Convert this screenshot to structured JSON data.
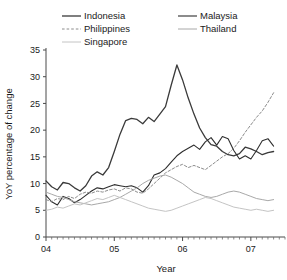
{
  "chart_data": {
    "type": "line",
    "title": "",
    "xlabel": "Year",
    "ylabel": "YoY percentage of change",
    "xlim": [
      2004.0,
      2007.5
    ],
    "ylim": [
      0,
      35
    ],
    "yticks": [
      0,
      5,
      10,
      15,
      20,
      25,
      30,
      35
    ],
    "ytick_labels": [
      "0",
      "5",
      "10",
      "15",
      "20",
      "25",
      "30",
      "35"
    ],
    "xticks": [
      2004,
      2005,
      2006,
      2007
    ],
    "xtick_labels": [
      "04",
      "05",
      "06",
      "07"
    ],
    "grid": false,
    "legend_position": "top",
    "legend_columns": 2,
    "x": [
      2004.0,
      2004.083,
      2004.167,
      2004.25,
      2004.333,
      2004.417,
      2004.5,
      2004.583,
      2004.667,
      2004.75,
      2004.833,
      2004.917,
      2005.0,
      2005.083,
      2005.167,
      2005.25,
      2005.333,
      2005.417,
      2005.5,
      2005.583,
      2005.667,
      2005.75,
      2005.833,
      2005.917,
      2006.0,
      2006.083,
      2006.167,
      2006.25,
      2006.333,
      2006.417,
      2006.5,
      2006.583,
      2006.667,
      2006.75,
      2006.833,
      2006.917,
      2007.0,
      2007.083,
      2007.167,
      2007.25,
      2007.333
    ],
    "series": [
      {
        "name": "Indonesia",
        "color": "#3a3a3a",
        "style": "solid",
        "width": 1.3,
        "values": [
          10.5,
          9.4,
          8.8,
          10.2,
          10.0,
          9.2,
          8.6,
          9.6,
          11.4,
          12.2,
          11.6,
          13.0,
          16.0,
          19.2,
          21.8,
          22.2,
          22.0,
          21.2,
          22.4,
          21.6,
          23.0,
          24.4,
          28.4,
          32.2,
          29.4,
          26.0,
          23.0,
          20.4,
          18.6,
          17.3,
          17.0,
          16.0,
          15.4,
          15.2,
          15.6,
          16.8,
          16.5,
          16.0,
          15.4,
          15.8,
          16.0
        ]
      },
      {
        "name": "Malaysia",
        "color": "#2e2e2e",
        "style": "solid",
        "width": 1.1,
        "values": [
          7.8,
          6.6,
          6.0,
          7.6,
          7.2,
          6.4,
          7.0,
          7.8,
          8.6,
          9.2,
          9.0,
          9.4,
          9.8,
          9.6,
          9.4,
          9.6,
          9.2,
          8.4,
          9.6,
          11.6,
          12.0,
          12.8,
          14.0,
          15.2,
          16.0,
          16.6,
          17.2,
          16.4,
          17.8,
          18.6,
          17.2,
          18.8,
          18.4,
          16.2,
          14.6,
          15.2,
          14.6,
          16.2,
          18.0,
          18.4,
          17.0
        ]
      },
      {
        "name": "Philippines",
        "color": "#8c8c8c",
        "style": "dashed",
        "width": 1.0,
        "values": [
          7.0,
          6.6,
          7.2,
          7.0,
          7.6,
          7.2,
          8.0,
          8.4,
          8.2,
          8.6,
          8.4,
          8.8,
          9.0,
          8.6,
          9.2,
          9.0,
          8.4,
          8.2,
          9.0,
          10.0,
          11.0,
          12.0,
          12.6,
          13.2,
          13.6,
          13.0,
          13.4,
          13.0,
          12.6,
          13.4,
          14.2,
          15.0,
          15.6,
          16.6,
          18.0,
          19.6,
          21.0,
          22.4,
          23.6,
          25.2,
          27.0
        ]
      },
      {
        "name": "Thailand",
        "color": "#a8a8a8",
        "style": "solid",
        "width": 1.0,
        "values": [
          8.4,
          8.0,
          7.6,
          7.4,
          7.0,
          6.6,
          6.4,
          6.2,
          6.0,
          6.2,
          6.4,
          6.6,
          7.0,
          7.4,
          8.0,
          8.6,
          9.2,
          10.0,
          10.6,
          11.0,
          11.4,
          11.6,
          11.2,
          10.6,
          10.0,
          9.2,
          8.4,
          8.0,
          7.6,
          7.4,
          7.6,
          8.0,
          8.4,
          8.6,
          8.4,
          8.0,
          7.6,
          7.2,
          7.0,
          6.8,
          7.0
        ]
      },
      {
        "name": "Singapore",
        "color": "#c4c4c4",
        "style": "solid",
        "width": 1.0,
        "values": [
          5.0,
          5.2,
          5.6,
          5.4,
          5.8,
          6.2,
          6.0,
          6.4,
          6.8,
          7.2,
          7.0,
          7.4,
          7.8,
          7.4,
          7.0,
          6.6,
          6.2,
          5.8,
          5.4,
          5.2,
          5.0,
          4.8,
          5.0,
          5.4,
          5.8,
          6.2,
          6.6,
          7.0,
          7.4,
          7.2,
          6.8,
          6.4,
          6.0,
          5.6,
          5.4,
          5.2,
          5.0,
          5.2,
          5.0,
          4.8,
          5.0
        ]
      }
    ]
  },
  "legend": {
    "entries": [
      {
        "label": "Indonesia"
      },
      {
        "label": "Malaysia"
      },
      {
        "label": "Philippines"
      },
      {
        "label": "Thailand"
      },
      {
        "label": "Singapore"
      }
    ]
  },
  "axes": {
    "y_title": "YoY percentage of change",
    "x_title": "Year"
  }
}
